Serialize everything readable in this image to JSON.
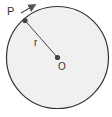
{
  "diagram": {
    "type": "circle-radius",
    "circle": {
      "cx": 57.5,
      "cy": 57.5,
      "r": 51,
      "fill": "#f0f0f0",
      "stroke": "#333333"
    },
    "center": {
      "label": "O",
      "x": 57.5,
      "y": 57.5
    },
    "point": {
      "label": "P",
      "x": 25,
      "y": 20
    },
    "radius": {
      "label": "r"
    },
    "motion_arrow": {
      "direction": "clockwise",
      "color": "#555555"
    }
  }
}
